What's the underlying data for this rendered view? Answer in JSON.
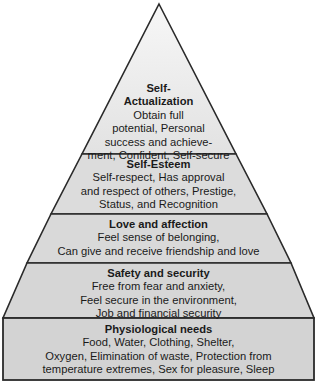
{
  "diagram": {
    "type": "pyramid",
    "title": "",
    "colors": {
      "fill": "#d8d8d8",
      "apex_fill": "#f0f0f0",
      "stroke": "#2a2a2a",
      "text": "#1a1a1a"
    },
    "levels": [
      {
        "title": "Self-\nActualization",
        "description": "Obtain full\npotential, Personal\nsuccess and achieve-\nment, Confident, Self-secure"
      },
      {
        "title": "Self-Esteem",
        "description": "Self-respect, Has approval\nand respect of others, Prestige,\nStatus, and Recognition"
      },
      {
        "title": "Love and affection",
        "description": "Feel sense of belonging,\nCan give and receive friendship and love"
      },
      {
        "title": "Safety and security",
        "description": "Free from fear and anxiety,\nFeel secure in the environment,\nJob and financial security"
      },
      {
        "title": "Physiological needs",
        "description": "Food, Water, Clothing, Shelter,\nOxygen, Elimination of waste, Protection from\ntemperature extremes, Sex for pleasure, Sleep"
      }
    ]
  }
}
